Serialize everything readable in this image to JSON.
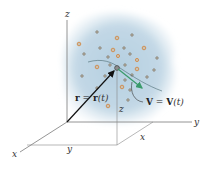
{
  "figure": {
    "axes": {
      "x_label": "x",
      "y_label": "y",
      "z_label": "z"
    },
    "coordinate_labels": {
      "x": "x",
      "y": "y",
      "z": "z"
    },
    "position_vector": {
      "lhs": "r",
      "eq": " = ",
      "rhs": "r",
      "arg": "(t)"
    },
    "velocity_vector": {
      "lhs": "V",
      "eq": " = ",
      "rhs": "V",
      "arg": "(t)"
    },
    "colors": {
      "cloud": "#b9d3e3",
      "particle_fill": "#c9c2b4",
      "particle_ring": "#e0a060",
      "velocity_arrow": "#3a9a6a",
      "axis": "#777777",
      "position_arrow": "#111111"
    }
  }
}
